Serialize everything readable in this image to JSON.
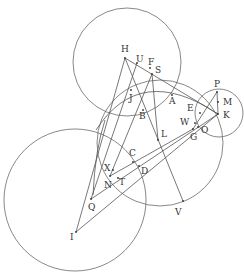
{
  "diagram": {
    "stroke_color": "#6a6a6a",
    "label_color": "#333333",
    "circles": [
      {
        "name": "circle-upper",
        "cx": 127,
        "cy": 62,
        "r": 54
      },
      {
        "name": "circle-lower-left",
        "cx": 75,
        "cy": 200,
        "r": 71
      },
      {
        "name": "circle-middle",
        "cx": 160,
        "cy": 143,
        "r": 63
      },
      {
        "name": "circle-small-right",
        "cx": 219,
        "cy": 113,
        "r": 24
      }
    ],
    "points": {
      "H": [
        125,
        58
      ],
      "U": [
        137,
        63
      ],
      "F": [
        150,
        68
      ],
      "S": [
        152,
        74
      ],
      "J": [
        131,
        90
      ],
      "A": [
        172,
        95
      ],
      "B": [
        143,
        110
      ],
      "E": [
        200,
        113
      ],
      "P": [
        217,
        92
      ],
      "M": [
        218,
        102
      ],
      "K": [
        218,
        114
      ],
      "W": [
        195,
        123
      ],
      "O": [
        198,
        127
      ],
      "G": [
        193,
        129
      ],
      "L": [
        158,
        140
      ],
      "C": [
        133,
        162
      ],
      "D": [
        139,
        166
      ],
      "X": [
        113,
        170
      ],
      "N": [
        110,
        176
      ],
      "T": [
        118,
        178
      ],
      "Q": [
        91,
        199
      ],
      "I": [
        76,
        232
      ],
      "V": [
        183,
        201
      ]
    },
    "labels": [
      {
        "text": "H",
        "x": 121,
        "y": 52
      },
      {
        "text": "U",
        "x": 136,
        "y": 62
      },
      {
        "text": "F",
        "x": 148,
        "y": 65
      },
      {
        "text": "S",
        "x": 155,
        "y": 73
      },
      {
        "text": "J",
        "x": 129,
        "y": 101
      },
      {
        "text": "A",
        "x": 169,
        "y": 104
      },
      {
        "text": "B",
        "x": 139,
        "y": 119
      },
      {
        "text": "E",
        "x": 187,
        "y": 111
      },
      {
        "text": "P",
        "x": 214,
        "y": 87
      },
      {
        "text": "M",
        "x": 223,
        "y": 105
      },
      {
        "text": "K",
        "x": 223,
        "y": 118
      },
      {
        "text": "W",
        "x": 180,
        "y": 125
      },
      {
        "text": "O",
        "x": 201,
        "y": 133
      },
      {
        "text": "G",
        "x": 190,
        "y": 140
      },
      {
        "text": "L",
        "x": 161,
        "y": 137
      },
      {
        "text": "C",
        "x": 129,
        "y": 156
      },
      {
        "text": "D",
        "x": 141,
        "y": 174
      },
      {
        "text": "X",
        "x": 104,
        "y": 171
      },
      {
        "text": "N",
        "x": 104,
        "y": 188
      },
      {
        "text": "T",
        "x": 119,
        "y": 185
      },
      {
        "text": "Q",
        "x": 88,
        "y": 210
      },
      {
        "text": "I",
        "x": 70,
        "y": 240
      },
      {
        "text": "V",
        "x": 175,
        "y": 215
      }
    ],
    "segments": [
      [
        "H",
        "K"
      ],
      [
        "H",
        "I"
      ],
      [
        "H",
        "V"
      ],
      [
        "U",
        "Q"
      ],
      [
        "S",
        "N"
      ],
      [
        "S",
        "L"
      ],
      [
        "I",
        "K"
      ],
      [
        "Q",
        "K"
      ],
      [
        "N",
        "G"
      ],
      [
        "P",
        "K"
      ],
      [
        "P",
        "G"
      ]
    ]
  }
}
